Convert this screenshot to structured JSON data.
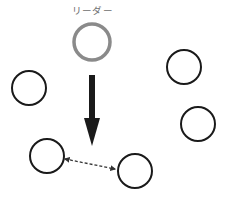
{
  "diagram": {
    "leader": {
      "label": "リーダー",
      "cx": 92,
      "cy": 42,
      "r": 18,
      "stroke": "#8a8a8a",
      "stroke_width": 3.5
    },
    "members": [
      {
        "id": "member-left",
        "cx": 29,
        "cy": 88,
        "r": 17
      },
      {
        "id": "member-top-right",
        "cx": 184,
        "cy": 67,
        "r": 17
      },
      {
        "id": "member-right",
        "cx": 198,
        "cy": 124,
        "r": 17
      },
      {
        "id": "member-bottom-left",
        "cx": 47,
        "cy": 156,
        "r": 17
      },
      {
        "id": "member-bottom-right",
        "cx": 135,
        "cy": 171,
        "r": 17
      }
    ],
    "member_style": {
      "stroke": "#1a1a1a",
      "stroke_width": 2
    },
    "down_arrow": {
      "x": 92,
      "y_start": 75,
      "y_end": 146,
      "shaft_width": 6,
      "head_width": 16,
      "head_length": 28,
      "color": "#1a1a1a"
    },
    "dashed_link": {
      "from": {
        "x": 65,
        "y": 159
      },
      "to": {
        "x": 115,
        "y": 169
      },
      "color": "#333333",
      "dash": "3,2",
      "bidirectional": true
    }
  }
}
